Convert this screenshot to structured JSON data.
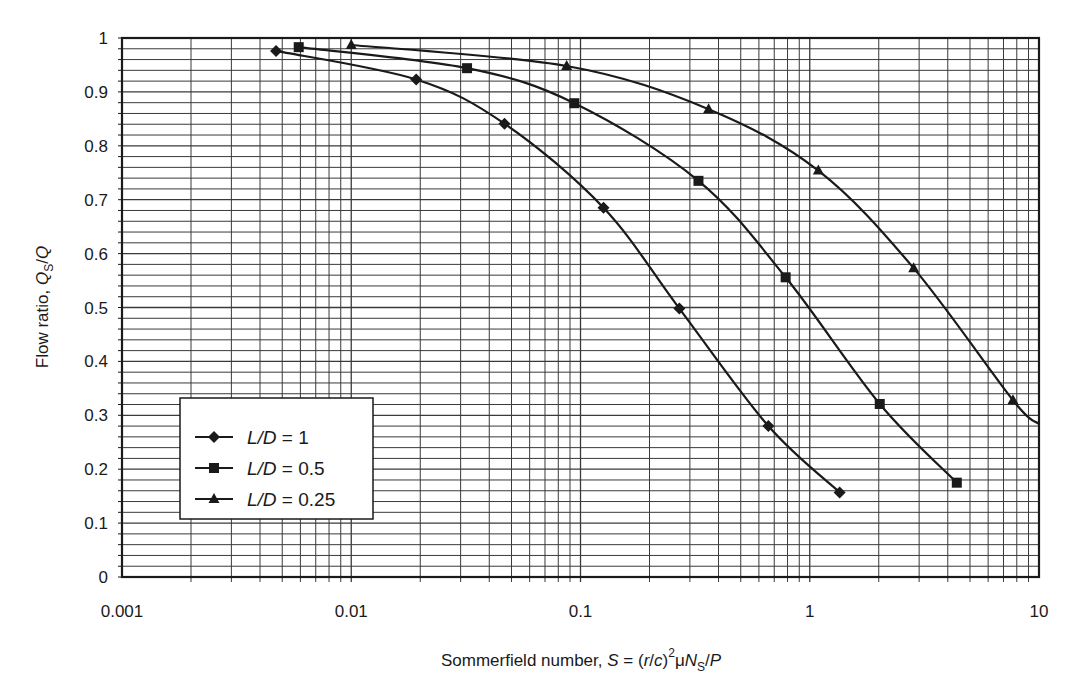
{
  "chart_data": {
    "type": "line",
    "title": "",
    "xlabel": "Sommerfield number, S = (r/c)^2 μN_S/P",
    "ylabel": "Flow ratio, Q_S/Q",
    "xscale": "log",
    "xlim": [
      0.001,
      10
    ],
    "ylim": [
      0,
      1
    ],
    "grid": true,
    "legend_position": "lower-left (inside plot)",
    "x_ticks": [
      "0.001",
      "0.01",
      "0.1",
      "1",
      "10"
    ],
    "y_ticks": [
      "0",
      "0.1",
      "0.2",
      "0.3",
      "0.4",
      "0.5",
      "0.6",
      "0.7",
      "0.8",
      "0.9",
      "1"
    ],
    "series": [
      {
        "name": "L/D = 1",
        "marker": "diamond",
        "x": [
          0.0047,
          0.0192,
          0.0466,
          0.126,
          0.27,
          0.66,
          1.35
        ],
        "y": [
          0.976,
          0.923,
          0.841,
          0.685,
          0.498,
          0.28,
          0.157
        ]
      },
      {
        "name": "L/D = 0.5",
        "marker": "square",
        "x": [
          0.0059,
          0.032,
          0.094,
          0.327,
          0.785,
          2.02,
          4.38
        ],
        "y": [
          0.983,
          0.944,
          0.879,
          0.735,
          0.556,
          0.321,
          0.175
        ]
      },
      {
        "name": "L/D = 0.25",
        "marker": "triangle",
        "x": [
          0.01,
          0.087,
          0.362,
          1.09,
          2.84,
          7.7,
          10
        ],
        "y": [
          0.987,
          0.948,
          0.868,
          0.754,
          0.573,
          0.328,
          0.284
        ],
        "last_point_unmarked": true
      }
    ]
  },
  "axes": {
    "x_title_parts": {
      "prefix": "Sommerfield number, ",
      "S": "S",
      "eq": " = (",
      "r": "r",
      "slash": "/",
      "c": "c",
      "close": ")",
      "sup": "2",
      "mu": "μ",
      "N": "N",
      "sub": "S",
      "tail": "/",
      "P": "P"
    },
    "y_title_parts": {
      "prefix": "Flow ratio, ",
      "Q": "Q",
      "sub": "S",
      "tail": "/",
      "Q2": "Q"
    }
  },
  "legend": {
    "items": [
      {
        "var": "L/D",
        "eq": " = ",
        "value": "1",
        "marker": "diamond"
      },
      {
        "var": "L/D",
        "eq": " = ",
        "value": "0.5",
        "marker": "square"
      },
      {
        "var": "L/D",
        "eq": " = ",
        "value": "0.25",
        "marker": "triangle"
      }
    ]
  },
  "style": {
    "line_color": "#1a1a1a",
    "grid_color": "#3a3a3a",
    "background": "#ffffff"
  }
}
